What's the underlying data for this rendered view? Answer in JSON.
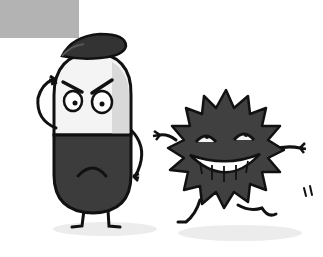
{
  "scene": {
    "description": "Cartoon illustration: an angry pill character wearing a cap faces a laughing dancing virus germ",
    "colors": {
      "background": "#ffffff",
      "label_box": "#b3b3b3",
      "pill_top": "#f4f4f4",
      "pill_shade": "#d9d9d9",
      "pill_bottom": "#3c3c3c",
      "cap": "#333333",
      "virus_body": "#404040",
      "outline": "#111111",
      "shadow": "#ececec"
    },
    "characters": [
      {
        "name": "pill",
        "expression": "angry"
      },
      {
        "name": "virus",
        "expression": "laughing"
      }
    ]
  }
}
